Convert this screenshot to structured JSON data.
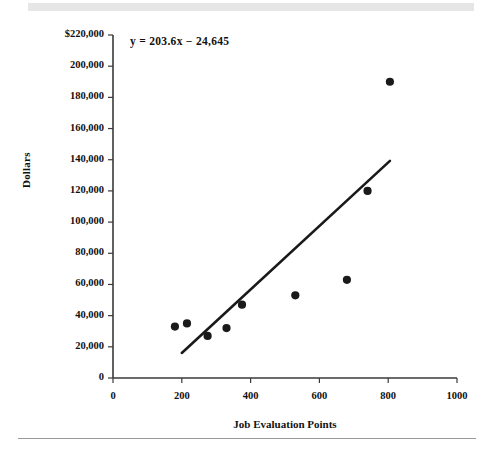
{
  "figure": {
    "equation_annotation": "y = 203.6x − 24,645"
  },
  "chart_data": {
    "type": "scatter",
    "title": "",
    "xlabel": "Job Evaluation Points",
    "ylabel": "Dollars",
    "xlim": [
      0,
      1000
    ],
    "ylim": [
      0,
      220000
    ],
    "grid": false,
    "legend": "none",
    "x_ticks": [
      0,
      200,
      400,
      600,
      800,
      1000
    ],
    "x_tick_labels": [
      "0",
      "200",
      "400",
      "600",
      "800",
      "1000"
    ],
    "y_ticks": [
      0,
      20000,
      40000,
      60000,
      80000,
      100000,
      120000,
      140000,
      160000,
      180000,
      200000,
      220000
    ],
    "y_tick_labels": [
      "0",
      "20,000",
      "40,000",
      "60,000",
      "80,000",
      "100,000",
      "120,000",
      "140,000",
      "160,000",
      "180,000",
      "200,000",
      "$220,000"
    ],
    "series": [
      {
        "name": "Job data points",
        "type": "scatter",
        "marker": "circle",
        "color": "#1a1a1a",
        "points": [
          {
            "x": 180,
            "y": 33000
          },
          {
            "x": 215,
            "y": 35000
          },
          {
            "x": 275,
            "y": 27000
          },
          {
            "x": 330,
            "y": 32000
          },
          {
            "x": 375,
            "y": 47000
          },
          {
            "x": 530,
            "y": 53000
          },
          {
            "x": 680,
            "y": 63000
          },
          {
            "x": 740,
            "y": 120000
          },
          {
            "x": 805,
            "y": 190000
          }
        ]
      },
      {
        "name": "Regression line",
        "type": "line",
        "color": "#1a1a1a",
        "equation": "y = 203.6x - 24645",
        "slope": 203.6,
        "intercept": -24645,
        "x_start": 200,
        "x_end": 805,
        "y_start": 16075,
        "y_end": 139253
      }
    ]
  }
}
